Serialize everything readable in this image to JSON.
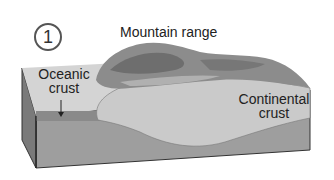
{
  "diagram": {
    "step_number": "1",
    "title": "Mountain range",
    "labels": {
      "oceanic_crust": [
        "Oceanic",
        "crust"
      ],
      "continental_crust": [
        "Continental",
        "crust"
      ]
    },
    "colors": {
      "ocean_surface": "#d2d2d2",
      "oceanic_crust": "#8a8a8a",
      "continental_crust": "#c8c8c8",
      "mantle": "#9e9e9e",
      "mountain_dark": "#6e6e6e",
      "mountain_light": "#a8a8a8",
      "side_face": "#7a7a7a"
    }
  }
}
